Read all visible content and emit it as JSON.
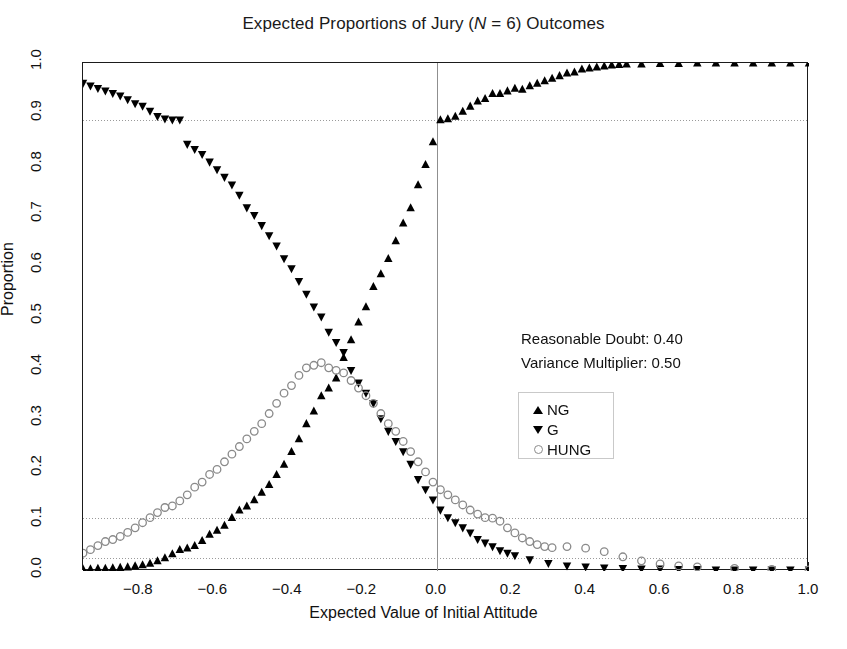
{
  "chart_data": {
    "type": "scatter",
    "title": "Expected Proportions of Jury (N = 6) Outcomes",
    "title_plain": "Expected Proportions of Jury (N = 6) Outcomes",
    "title_pre": "Expected Proportions of Jury (",
    "title_italic": "N",
    "title_post": " = 6) Outcomes",
    "xlabel": "Expected Value of Initial Attitude",
    "ylabel": "Proportion",
    "xlim": [
      -0.95,
      1.0
    ],
    "ylim": [
      0.0,
      1.0
    ],
    "xticks": [
      -0.8,
      -0.6,
      -0.4,
      -0.2,
      0.0,
      0.2,
      0.4,
      0.6,
      0.8,
      1.0
    ],
    "xticklabels": [
      "−0.8",
      "−0.6",
      "−0.4",
      "−0.2",
      "0.0",
      "0.2",
      "0.4",
      "0.6",
      "0.8",
      "1.0"
    ],
    "yticks": [
      0.0,
      0.1,
      0.2,
      0.3,
      0.4,
      0.5,
      0.6,
      0.7,
      0.8,
      0.9,
      1.0
    ],
    "yticklabels": [
      "0.0",
      "0.1",
      "0.2",
      "0.3",
      "0.4",
      "0.5",
      "0.6",
      "0.7",
      "0.8",
      "0.9",
      "1.0"
    ],
    "grid": false,
    "reference_lines": {
      "vertical": [
        0.0
      ],
      "horizontal": [
        0.888,
        0.104,
        0.025
      ],
      "style": "dotted",
      "color": "#9a9a9a"
    },
    "legend_position": "center-right",
    "marker_color": "#000000",
    "hung_marker_color": "#8a8a8a",
    "series": [
      {
        "name": "NG",
        "marker": "triangle-up",
        "color": "#000000",
        "x": [
          -0.95,
          -0.93,
          -0.91,
          -0.89,
          -0.87,
          -0.85,
          -0.83,
          -0.81,
          -0.79,
          -0.77,
          -0.75,
          -0.73,
          -0.71,
          -0.69,
          -0.67,
          -0.65,
          -0.63,
          -0.61,
          -0.59,
          -0.57,
          -0.55,
          -0.53,
          -0.51,
          -0.49,
          -0.47,
          -0.45,
          -0.43,
          -0.41,
          -0.39,
          -0.37,
          -0.35,
          -0.33,
          -0.31,
          -0.29,
          -0.27,
          -0.25,
          -0.23,
          -0.21,
          -0.19,
          -0.17,
          -0.15,
          -0.13,
          -0.11,
          -0.09,
          -0.07,
          -0.05,
          -0.03,
          -0.01,
          0.01,
          0.03,
          0.05,
          0.07,
          0.09,
          0.11,
          0.13,
          0.15,
          0.17,
          0.19,
          0.21,
          0.23,
          0.25,
          0.27,
          0.29,
          0.31,
          0.33,
          0.35,
          0.37,
          0.39,
          0.41,
          0.43,
          0.45,
          0.47,
          0.49,
          0.51,
          0.55,
          0.6,
          0.65,
          0.7,
          0.75,
          0.8,
          0.85,
          0.9,
          0.95,
          1.0
        ],
        "y": [
          0.004,
          0.004,
          0.005,
          0.005,
          0.006,
          0.007,
          0.008,
          0.01,
          0.012,
          0.015,
          0.02,
          0.026,
          0.034,
          0.042,
          0.045,
          0.05,
          0.06,
          0.072,
          0.08,
          0.09,
          0.105,
          0.12,
          0.128,
          0.14,
          0.155,
          0.17,
          0.19,
          0.21,
          0.235,
          0.26,
          0.29,
          0.315,
          0.345,
          0.36,
          0.38,
          0.42,
          0.455,
          0.49,
          0.52,
          0.56,
          0.585,
          0.615,
          0.65,
          0.685,
          0.715,
          0.76,
          0.8,
          0.845,
          0.888,
          0.89,
          0.895,
          0.905,
          0.915,
          0.925,
          0.93,
          0.94,
          0.94,
          0.945,
          0.95,
          0.948,
          0.955,
          0.96,
          0.965,
          0.97,
          0.975,
          0.98,
          0.982,
          0.988,
          0.99,
          0.992,
          0.994,
          0.996,
          0.997,
          0.998,
          0.998,
          0.999,
          0.999,
          1.0,
          1.0,
          1.0,
          1.0,
          1.0,
          1.0,
          1.0
        ]
      },
      {
        "name": "G",
        "marker": "triangle-down",
        "color": "#000000",
        "x": [
          -0.95,
          -0.93,
          -0.91,
          -0.89,
          -0.87,
          -0.85,
          -0.83,
          -0.81,
          -0.79,
          -0.77,
          -0.75,
          -0.73,
          -0.71,
          -0.69,
          -0.67,
          -0.65,
          -0.63,
          -0.61,
          -0.59,
          -0.57,
          -0.55,
          -0.53,
          -0.51,
          -0.49,
          -0.47,
          -0.45,
          -0.43,
          -0.41,
          -0.39,
          -0.37,
          -0.35,
          -0.33,
          -0.31,
          -0.29,
          -0.27,
          -0.25,
          -0.23,
          -0.21,
          -0.19,
          -0.17,
          -0.15,
          -0.13,
          -0.11,
          -0.09,
          -0.07,
          -0.05,
          -0.03,
          -0.01,
          0.01,
          0.03,
          0.05,
          0.07,
          0.09,
          0.11,
          0.13,
          0.15,
          0.17,
          0.19,
          0.21,
          0.25,
          0.3,
          0.35,
          0.4,
          0.45,
          0.5,
          0.55,
          0.6,
          0.65,
          0.7,
          0.75,
          0.8,
          0.85,
          0.9,
          0.95,
          1.0
        ],
        "y": [
          0.96,
          0.955,
          0.95,
          0.945,
          0.94,
          0.935,
          0.928,
          0.92,
          0.915,
          0.905,
          0.895,
          0.89,
          0.888,
          0.888,
          0.84,
          0.83,
          0.82,
          0.805,
          0.79,
          0.775,
          0.76,
          0.74,
          0.715,
          0.7,
          0.68,
          0.66,
          0.64,
          0.615,
          0.595,
          0.57,
          0.545,
          0.52,
          0.5,
          0.47,
          0.45,
          0.43,
          0.395,
          0.37,
          0.35,
          0.33,
          0.3,
          0.275,
          0.255,
          0.235,
          0.21,
          0.18,
          0.16,
          0.14,
          0.12,
          0.105,
          0.095,
          0.085,
          0.075,
          0.062,
          0.055,
          0.048,
          0.04,
          0.035,
          0.03,
          0.022,
          0.015,
          0.01,
          0.008,
          0.006,
          0.005,
          0.004,
          0.004,
          0.003,
          0.003,
          0.002,
          0.002,
          0.002,
          0.002,
          0.002,
          0.002
        ]
      },
      {
        "name": "HUNG",
        "marker": "circle-open",
        "color": "#8a8a8a",
        "x": [
          -0.95,
          -0.93,
          -0.91,
          -0.89,
          -0.87,
          -0.85,
          -0.83,
          -0.81,
          -0.79,
          -0.77,
          -0.75,
          -0.73,
          -0.71,
          -0.69,
          -0.67,
          -0.65,
          -0.63,
          -0.61,
          -0.59,
          -0.57,
          -0.55,
          -0.53,
          -0.51,
          -0.49,
          -0.47,
          -0.45,
          -0.43,
          -0.41,
          -0.39,
          -0.37,
          -0.35,
          -0.33,
          -0.31,
          -0.29,
          -0.27,
          -0.25,
          -0.23,
          -0.21,
          -0.19,
          -0.17,
          -0.15,
          -0.13,
          -0.11,
          -0.09,
          -0.07,
          -0.05,
          -0.03,
          -0.01,
          0.01,
          0.03,
          0.05,
          0.07,
          0.09,
          0.11,
          0.13,
          0.15,
          0.17,
          0.19,
          0.21,
          0.23,
          0.25,
          0.27,
          0.29,
          0.31,
          0.35,
          0.4,
          0.45,
          0.5,
          0.55,
          0.6,
          0.65,
          0.7,
          0.8,
          0.9,
          1.0
        ],
        "y": [
          0.035,
          0.042,
          0.05,
          0.058,
          0.062,
          0.068,
          0.076,
          0.085,
          0.095,
          0.105,
          0.115,
          0.125,
          0.128,
          0.138,
          0.15,
          0.165,
          0.175,
          0.19,
          0.2,
          0.215,
          0.23,
          0.245,
          0.26,
          0.275,
          0.29,
          0.31,
          0.33,
          0.35,
          0.365,
          0.385,
          0.4,
          0.405,
          0.41,
          0.4,
          0.395,
          0.39,
          0.375,
          0.36,
          0.345,
          0.33,
          0.31,
          0.29,
          0.275,
          0.255,
          0.235,
          0.215,
          0.195,
          0.175,
          0.16,
          0.15,
          0.14,
          0.13,
          0.12,
          0.112,
          0.105,
          0.104,
          0.098,
          0.085,
          0.075,
          0.065,
          0.058,
          0.052,
          0.048,
          0.046,
          0.048,
          0.045,
          0.038,
          0.028,
          0.02,
          0.014,
          0.01,
          0.008,
          0.005,
          0.003,
          0.002
        ]
      }
    ],
    "annotations": [
      {
        "name": "reasonable-doubt",
        "label": "Reasonable Doubt: 0.40",
        "value": 0.4
      },
      {
        "name": "variance-multiplier",
        "label": "Variance Multiplier: 0.50",
        "value": 0.5
      }
    ],
    "legend_entries": [
      {
        "label": "NG",
        "symbol": "triangle-up"
      },
      {
        "label": "G",
        "symbol": "triangle-down"
      },
      {
        "label": "HUNG",
        "symbol": "circle-open"
      }
    ]
  }
}
